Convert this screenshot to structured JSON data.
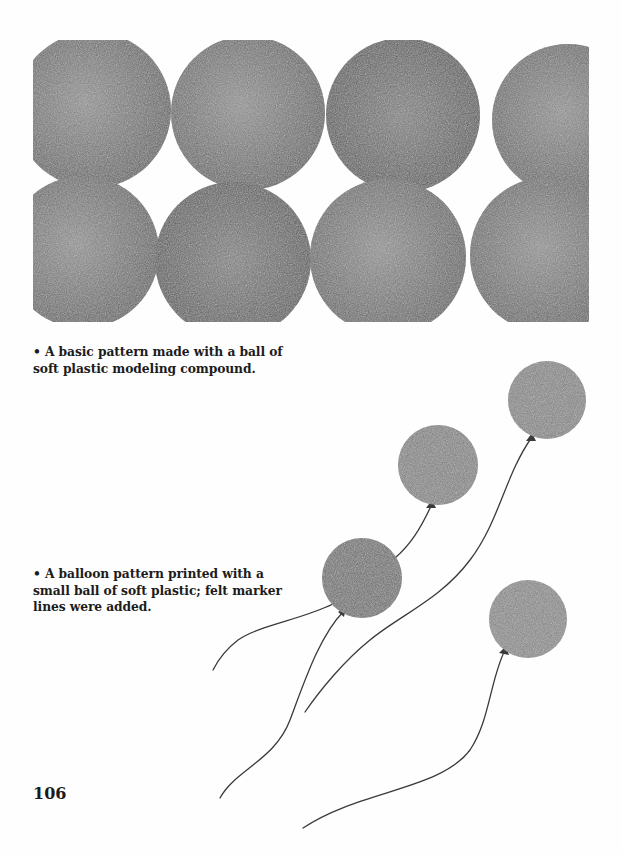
{
  "page": {
    "number": "106",
    "background": "#fefefe"
  },
  "figures": {
    "pattern": {
      "description": "basic circle print pattern, two staggered rows",
      "ink_color": "#6a6a6a",
      "rows": 2,
      "circles_per_row": 4
    },
    "balloons": {
      "description": "balloon prints with felt marker strings",
      "count": 5,
      "ink_color": "#727272",
      "string_color": "#3a3a3a"
    }
  },
  "captions": {
    "first": {
      "bullet": "•",
      "text": "A basic pattern made with a ball of soft plastic modeling compound."
    },
    "second": {
      "bullet": "•",
      "text": "A balloon pattern printed with a small ball of soft plastic; felt marker lines were added."
    }
  }
}
